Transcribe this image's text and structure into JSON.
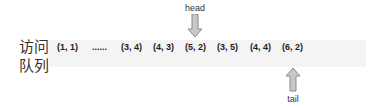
{
  "queue_label": [
    "访问",
    "队列"
  ],
  "cells": [
    {
      "text": "(1, 1)",
      "x": 57
    },
    {
      "text": "......",
      "x": 92
    },
    {
      "text": "(3, 4)",
      "x": 121
    },
    {
      "text": "(4, 3)",
      "x": 153
    },
    {
      "text": "(5, 2)",
      "x": 185
    },
    {
      "text": "(3, 5)",
      "x": 217
    },
    {
      "text": "(4, 4)",
      "x": 250
    },
    {
      "text": "(6, 2)",
      "x": 282
    }
  ],
  "head": {
    "label": "head",
    "x": 195
  },
  "tail": {
    "label": "tail",
    "x": 293
  },
  "colors": {
    "bar": "#f4f4f4",
    "arrow_fill": "#c8c8c8",
    "arrow_stroke": "#8a8a8a"
  }
}
